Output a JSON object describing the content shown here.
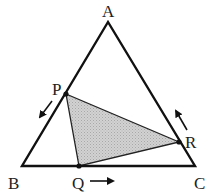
{
  "diagram": {
    "type": "triangle-with-inscribed-moving-points",
    "colors": {
      "stroke": "#111111",
      "shade": "#c9c9c9",
      "background": "#ffffff"
    },
    "vertices": {
      "A": {
        "label": "A",
        "x": 108,
        "y": 22
      },
      "B": {
        "label": "B",
        "x": 22,
        "y": 166
      },
      "C": {
        "label": "C",
        "x": 195,
        "y": 166
      }
    },
    "points": {
      "P": {
        "label": "P",
        "x": 66,
        "y": 94,
        "on_side": "AB",
        "motion": "toward B"
      },
      "Q": {
        "label": "Q",
        "x": 79,
        "y": 166,
        "on_side": "BC",
        "motion": "toward C"
      },
      "R": {
        "label": "R",
        "x": 179,
        "y": 142,
        "on_side": "CA",
        "motion": "toward A"
      }
    },
    "shaded_region": "triangle PQR",
    "arrows": [
      {
        "name": "P-direction",
        "from": [
          52,
          101
        ],
        "to": [
          38,
          119
        ]
      },
      {
        "name": "Q-direction",
        "from": [
          90,
          181
        ],
        "to": [
          116,
          181
        ]
      },
      {
        "name": "R-direction",
        "from": [
          187,
          130
        ],
        "to": [
          174,
          108
        ]
      }
    ]
  }
}
